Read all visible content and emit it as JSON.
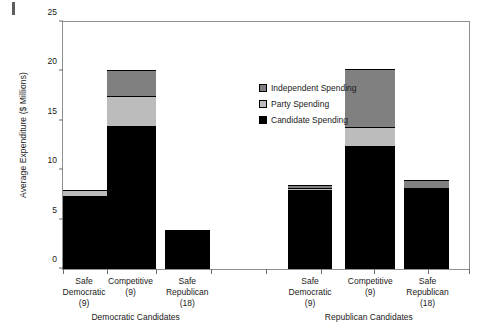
{
  "corner_mark": "",
  "legend": {
    "position": "inside-top-center-right",
    "items": [
      {
        "label": "Independent Spending",
        "color": "#808080",
        "key": "independent"
      },
      {
        "label": "Party Spending",
        "color": "#bcbcbc",
        "key": "party"
      },
      {
        "label": "Candidate Spending",
        "color": "#000000",
        "key": "candidate"
      }
    ]
  },
  "chart_data": {
    "type": "bar",
    "subtype": "stacked",
    "title": "",
    "xlabel": "",
    "ylabel": "Average Expenditure ($ Millions)",
    "ylim": [
      0,
      25
    ],
    "yticks": [
      0,
      5,
      10,
      15,
      20,
      25
    ],
    "ytick_labels": [
      "0",
      "5",
      "10",
      "15",
      "20",
      "25"
    ],
    "grid": false,
    "legend_position": "inside top center",
    "groups": [
      {
        "name": "Democratic Candidates",
        "categories": [
          {
            "label_lines": [
              "Safe",
              "Democratic",
              "(9)"
            ],
            "n": 9
          },
          {
            "label_lines": [
              "Competitive",
              "(9)"
            ],
            "n": 9
          },
          {
            "label_lines": [
              "Safe",
              "Republican",
              "(18)"
            ],
            "n": 18
          }
        ]
      },
      {
        "name": "Republican Candidates",
        "categories": [
          {
            "label_lines": [
              "Safe",
              "Democratic",
              "(9)"
            ],
            "n": 9
          },
          {
            "label_lines": [
              "Competitive",
              "(9)"
            ],
            "n": 9
          },
          {
            "label_lines": [
              "Safe",
              "Republican",
              "(18)"
            ],
            "n": 18
          }
        ]
      }
    ],
    "series": [
      {
        "name": "Candidate Spending",
        "key": "candidate",
        "color": "#000000",
        "values": [
          7.3,
          14.4,
          3.7,
          7.9,
          12.4,
          8.2
        ]
      },
      {
        "name": "Party Spending",
        "key": "party",
        "color": "#bcbcbc",
        "values": [
          0.7,
          3.1,
          0.1,
          0.3,
          2.0,
          0.0
        ]
      },
      {
        "name": "Independent Spending",
        "key": "independent",
        "color": "#808080",
        "values": [
          0.0,
          2.6,
          0.1,
          0.3,
          5.8,
          0.8
        ]
      }
    ],
    "bar_totals": [
      8.0,
      20.1,
      3.9,
      8.5,
      20.2,
      9.0
    ],
    "bar_positions_pct": [
      {
        "left": 0.0,
        "width": 10.8
      },
      {
        "left": 10.8,
        "width": 12.0
      },
      {
        "left": 25.2,
        "width": 11.0
      },
      {
        "left": 55.4,
        "width": 10.8
      },
      {
        "left": 69.4,
        "width": 12.3
      },
      {
        "left": 84.1,
        "width": 11.0
      }
    ],
    "x_tick_positions_pct": [
      0,
      10.8,
      23.0,
      36.5,
      50.0,
      63.5,
      76.5,
      90.0,
      100
    ]
  }
}
